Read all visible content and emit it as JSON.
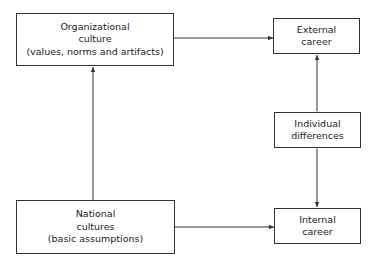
{
  "diagram": {
    "nodes": {
      "org_culture": {
        "lines": [
          "Organizational",
          "culture",
          "(values, norms and artifacts)"
        ]
      },
      "national_cultures": {
        "lines": [
          "National",
          "cultures",
          "(basic assumptions)"
        ]
      },
      "external_career": {
        "lines": [
          "External",
          "career"
        ]
      },
      "individual_differences": {
        "lines": [
          "Individual",
          "differences"
        ]
      },
      "internal_career": {
        "lines": [
          "Internal",
          "career"
        ]
      }
    },
    "edges": [
      {
        "from": "national_cultures",
        "to": "org_culture",
        "type": "single-arrow"
      },
      {
        "from": "org_culture",
        "to": "external_career",
        "type": "single-arrow"
      },
      {
        "from": "national_cultures",
        "to": "internal_career",
        "type": "single-arrow"
      },
      {
        "from": "external_career",
        "to": "individual_differences",
        "type": "double-arrow"
      },
      {
        "from": "individual_differences",
        "to": "internal_career",
        "type": "double-arrow"
      }
    ],
    "colors": {
      "line": "#333333",
      "background": "#ffffff"
    }
  }
}
